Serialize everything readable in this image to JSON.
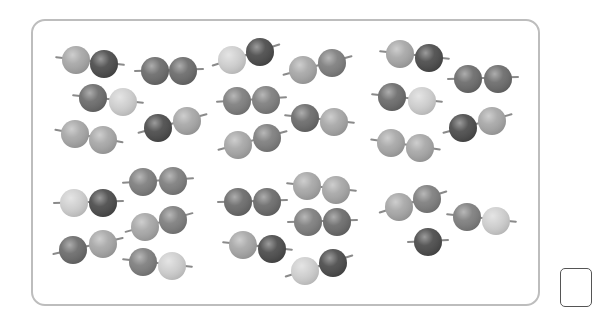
{
  "worksheet": {
    "description": "Groups of beads on strings, arranged in pairs",
    "bead_diameter": 28,
    "shades": {
      "dark": "#4a4a4a",
      "medium_dark": "#6a6a6a",
      "medium": "#7d7d7d",
      "light_medium": "#a6a6a6",
      "light": "#cfcfcf"
    },
    "frame": {
      "border_color": "#bdbdbd"
    },
    "groups": [
      {
        "name": "top-left",
        "pairs": [
          [
            {
              "x": 76,
              "y": 60,
              "shade": "light_medium"
            },
            {
              "x": 104,
              "y": 64,
              "shade": "dark"
            }
          ],
          [
            {
              "x": 155,
              "y": 71,
              "shade": "medium_dark"
            },
            {
              "x": 183,
              "y": 71,
              "shade": "medium_dark"
            }
          ],
          [
            {
              "x": 93,
              "y": 98,
              "shade": "medium_dark"
            },
            {
              "x": 123,
              "y": 102,
              "shade": "light"
            }
          ],
          [
            {
              "x": 75,
              "y": 134,
              "shade": "light_medium"
            },
            {
              "x": 103,
              "y": 140,
              "shade": "light_medium"
            }
          ],
          [
            {
              "x": 158,
              "y": 128,
              "shade": "dark"
            },
            {
              "x": 187,
              "y": 121,
              "shade": "light_medium"
            }
          ]
        ]
      },
      {
        "name": "top-middle",
        "pairs": [
          [
            {
              "x": 232,
              "y": 60,
              "shade": "light"
            },
            {
              "x": 260,
              "y": 52,
              "shade": "dark"
            }
          ],
          [
            {
              "x": 303,
              "y": 70,
              "shade": "light_medium"
            },
            {
              "x": 332,
              "y": 63,
              "shade": "medium"
            }
          ],
          [
            {
              "x": 237,
              "y": 101,
              "shade": "medium"
            },
            {
              "x": 266,
              "y": 100,
              "shade": "medium"
            }
          ],
          [
            {
              "x": 305,
              "y": 118,
              "shade": "medium_dark"
            },
            {
              "x": 334,
              "y": 122,
              "shade": "light_medium"
            }
          ],
          [
            {
              "x": 238,
              "y": 145,
              "shade": "light_medium"
            },
            {
              "x": 267,
              "y": 138,
              "shade": "medium"
            }
          ]
        ]
      },
      {
        "name": "top-right",
        "pairs": [
          [
            {
              "x": 400,
              "y": 54,
              "shade": "light_medium"
            },
            {
              "x": 429,
              "y": 58,
              "shade": "dark"
            }
          ],
          [
            {
              "x": 468,
              "y": 79,
              "shade": "medium_dark"
            },
            {
              "x": 498,
              "y": 79,
              "shade": "medium_dark"
            }
          ],
          [
            {
              "x": 392,
              "y": 97,
              "shade": "medium_dark"
            },
            {
              "x": 422,
              "y": 101,
              "shade": "light"
            }
          ],
          [
            {
              "x": 463,
              "y": 128,
              "shade": "dark"
            },
            {
              "x": 492,
              "y": 121,
              "shade": "light_medium"
            }
          ],
          [
            {
              "x": 391,
              "y": 143,
              "shade": "light_medium"
            },
            {
              "x": 420,
              "y": 148,
              "shade": "light_medium"
            }
          ]
        ]
      },
      {
        "name": "bottom-left",
        "pairs": [
          [
            {
              "x": 74,
              "y": 203,
              "shade": "light"
            },
            {
              "x": 103,
              "y": 203,
              "shade": "dark"
            }
          ],
          [
            {
              "x": 143,
              "y": 182,
              "shade": "medium"
            },
            {
              "x": 173,
              "y": 181,
              "shade": "medium"
            }
          ],
          [
            {
              "x": 145,
              "y": 227,
              "shade": "light_medium"
            },
            {
              "x": 173,
              "y": 220,
              "shade": "medium"
            }
          ],
          [
            {
              "x": 73,
              "y": 250,
              "shade": "medium_dark"
            },
            {
              "x": 103,
              "y": 244,
              "shade": "light_medium"
            }
          ],
          [
            {
              "x": 143,
              "y": 262,
              "shade": "medium"
            },
            {
              "x": 172,
              "y": 266,
              "shade": "light"
            }
          ]
        ]
      },
      {
        "name": "bottom-middle",
        "pairs": [
          [
            {
              "x": 238,
              "y": 202,
              "shade": "medium_dark"
            },
            {
              "x": 267,
              "y": 202,
              "shade": "medium_dark"
            }
          ],
          [
            {
              "x": 307,
              "y": 186,
              "shade": "light_medium"
            },
            {
              "x": 336,
              "y": 190,
              "shade": "light_medium"
            }
          ],
          [
            {
              "x": 308,
              "y": 222,
              "shade": "medium"
            },
            {
              "x": 337,
              "y": 222,
              "shade": "medium_dark"
            }
          ],
          [
            {
              "x": 243,
              "y": 245,
              "shade": "light_medium"
            },
            {
              "x": 272,
              "y": 249,
              "shade": "dark"
            }
          ],
          [
            {
              "x": 305,
              "y": 271,
              "shade": "light"
            },
            {
              "x": 333,
              "y": 263,
              "shade": "dark"
            }
          ]
        ]
      },
      {
        "name": "bottom-right",
        "pairs": [
          [
            {
              "x": 399,
              "y": 207,
              "shade": "light_medium"
            },
            {
              "x": 427,
              "y": 199,
              "shade": "medium"
            }
          ],
          [
            {
              "x": 467,
              "y": 217,
              "shade": "medium"
            },
            {
              "x": 496,
              "y": 221,
              "shade": "light"
            }
          ],
          [
            {
              "x": 428,
              "y": 242,
              "shade": "dark"
            }
          ]
        ]
      }
    ],
    "answer_box": {
      "value": ""
    }
  }
}
